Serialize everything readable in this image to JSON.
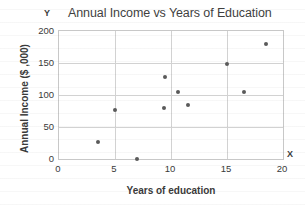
{
  "chart_data": {
    "type": "scatter",
    "title": "Annual Income vs Years of Education",
    "xlabel": "Years of education",
    "ylabel": "Annual Income ($ ,000)",
    "axis_marker_x": "X",
    "axis_marker_y": "Y",
    "xlim": [
      0,
      20
    ],
    "ylim": [
      0,
      200
    ],
    "xticks": [
      0,
      5,
      10,
      15,
      20
    ],
    "yticks": [
      0,
      50,
      100,
      150,
      200
    ],
    "xtick_labels": [
      "0",
      "5",
      "10",
      "15",
      "20"
    ],
    "ytick_labels": [
      "0",
      "50",
      "100",
      "150",
      "200"
    ],
    "grid": true,
    "legend": null,
    "marker_color": "#5a5a5a",
    "points": [
      {
        "x": 3.5,
        "y": 26
      },
      {
        "x": 5.0,
        "y": 77
      },
      {
        "x": 7.0,
        "y": 0
      },
      {
        "x": 9.4,
        "y": 80
      },
      {
        "x": 9.5,
        "y": 128
      },
      {
        "x": 10.6,
        "y": 105
      },
      {
        "x": 11.5,
        "y": 84
      },
      {
        "x": 15.0,
        "y": 149
      },
      {
        "x": 16.5,
        "y": 104
      },
      {
        "x": 18.5,
        "y": 179
      }
    ]
  }
}
